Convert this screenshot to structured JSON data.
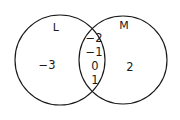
{
  "figure": {
    "type": "venn-diagram",
    "background_color": "#ffffff",
    "stroke_color": "#1a1a1a",
    "text_color": "#1a1a1a"
  },
  "sets": {
    "left": {
      "label": "L",
      "only_elements": [
        "−3"
      ]
    },
    "right": {
      "label": "M",
      "only_elements": [
        "2"
      ]
    },
    "intersection": {
      "elements": [
        "−2",
        "−1",
        "0",
        "1"
      ]
    }
  }
}
